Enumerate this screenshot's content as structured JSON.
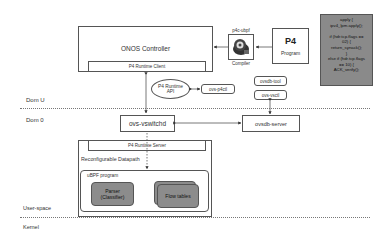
{
  "layers": {
    "dom_u": "Dom U",
    "dom_0": "Dom 0",
    "user_space": "User-space",
    "kernel": "Kernel"
  },
  "controller": {
    "title": "ONOS Controller",
    "client": "P4 Runtime Client"
  },
  "compiler": {
    "top_label": "p4c-ubpf",
    "bottom_label": "Compiler",
    "icon": "compiler-icon"
  },
  "program": {
    "logo": "P4",
    "label": "Program"
  },
  "code": {
    "lines": [
      "apply {",
      "ipv4_lpm.apply();",
      "",
      "if (hdr.tcp.flags ==",
      "02) {",
      "return_synack();",
      "}",
      "else if (hdr.tcp.flags",
      "== 10) {",
      "ACK_verify();"
    ]
  },
  "api": {
    "line1": "P4 Runtime",
    "line2": "API"
  },
  "tools": {
    "p4ctl": "ovs-p4ctl",
    "ovsdb_tool": "ovsdb-tool",
    "vsctl": "ovs-vsctl"
  },
  "dom0": {
    "vswitchd": "ovs-vswitchd",
    "ovsdb_server": "ovsdb-server",
    "runtime_server": "P4 Runtime Server",
    "datapath": "Reconfigurable Datapath",
    "ubpf": "uBPF program",
    "parser_line1": "Parser",
    "parser_line2": "(Classifier)",
    "flow_tables": "Flow tables"
  },
  "colors": {
    "block_gray": "#8c8c8c",
    "line": "#555555"
  }
}
